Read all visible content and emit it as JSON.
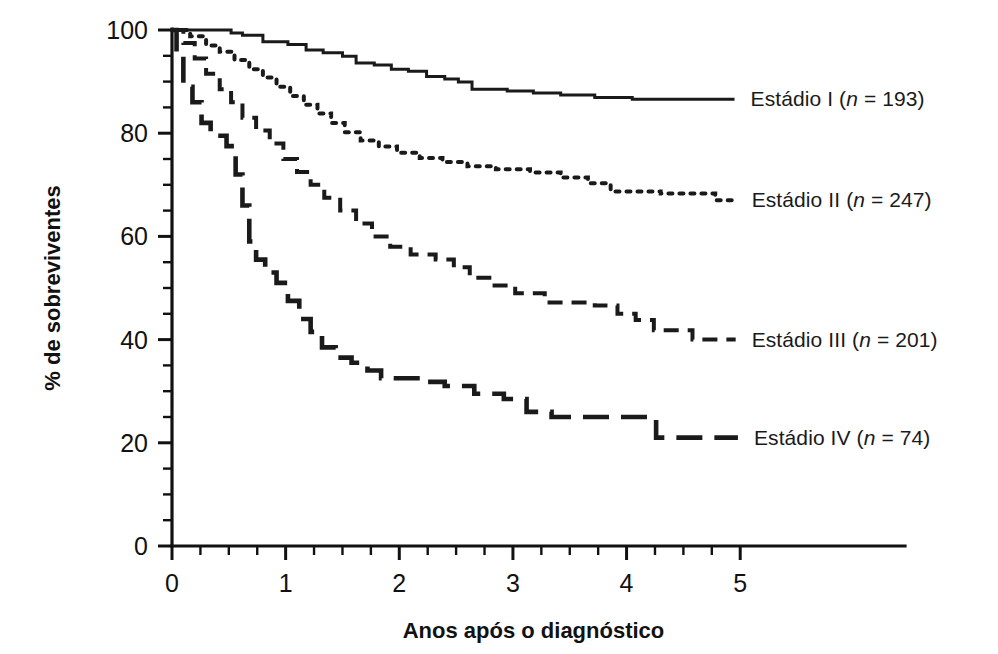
{
  "chart_data": {
    "type": "line",
    "title": "",
    "xlabel": "Anos após o diagnóstico",
    "ylabel": "% de sobreviventes",
    "xlim": [
      0,
      6.45
    ],
    "ylim": [
      0,
      100
    ],
    "grid": false,
    "legend_position": "right-inline",
    "x_ticks_major": [
      "0",
      "1",
      "2",
      "3",
      "4",
      "5"
    ],
    "x_ticks_major_values": [
      0,
      1,
      2,
      3,
      4,
      5
    ],
    "x_minor_step": 0.25,
    "y_ticks_major": [
      "0",
      "20",
      "40",
      "60",
      "80",
      "100"
    ],
    "y_ticks_major_values": [
      0,
      20,
      40,
      60,
      80,
      100
    ],
    "y_minor_step": 5,
    "series": [
      {
        "name": "Estádio I",
        "n": 193,
        "label": "Estádio I (n = 193)",
        "label_prefix": "Estádio I (",
        "label_n": "n",
        "label_suffix": " = 193)",
        "style": "solid",
        "final_value": 87,
        "points": [
          [
            0.0,
            100
          ],
          [
            0.52,
            100
          ],
          [
            0.52,
            99.4
          ],
          [
            0.62,
            99.4
          ],
          [
            0.62,
            99.0
          ],
          [
            0.8,
            99.0
          ],
          [
            0.8,
            97.7
          ],
          [
            1.02,
            97.7
          ],
          [
            1.02,
            97.2
          ],
          [
            1.18,
            97.2
          ],
          [
            1.18,
            96.1
          ],
          [
            1.33,
            96.1
          ],
          [
            1.33,
            95.6
          ],
          [
            1.5,
            95.6
          ],
          [
            1.5,
            94.9
          ],
          [
            1.62,
            94.9
          ],
          [
            1.62,
            93.6
          ],
          [
            1.78,
            93.6
          ],
          [
            1.78,
            93.2
          ],
          [
            1.93,
            93.2
          ],
          [
            1.93,
            92.4
          ],
          [
            2.08,
            92.4
          ],
          [
            2.08,
            92.0
          ],
          [
            2.24,
            92.0
          ],
          [
            2.24,
            91.0
          ],
          [
            2.4,
            91.0
          ],
          [
            2.4,
            90.5
          ],
          [
            2.52,
            90.5
          ],
          [
            2.52,
            89.9
          ],
          [
            2.64,
            89.9
          ],
          [
            2.64,
            88.5
          ],
          [
            2.95,
            88.5
          ],
          [
            2.95,
            88.2
          ],
          [
            3.18,
            88.2
          ],
          [
            3.18,
            87.8
          ],
          [
            3.42,
            87.8
          ],
          [
            3.42,
            87.4
          ],
          [
            3.72,
            87.4
          ],
          [
            3.72,
            86.9
          ],
          [
            4.05,
            86.9
          ],
          [
            4.05,
            86.6
          ],
          [
            4.95,
            86.6
          ]
        ]
      },
      {
        "name": "Estádio II",
        "n": 247,
        "label": "Estádio II (n = 247)",
        "label_prefix": "Estádio II (",
        "label_n": "n",
        "label_suffix": " = 247)",
        "style": "dotted",
        "final_value": 67,
        "points": [
          [
            0.0,
            100
          ],
          [
            0.16,
            100
          ],
          [
            0.16,
            98.8
          ],
          [
            0.3,
            98.8
          ],
          [
            0.3,
            97.0
          ],
          [
            0.42,
            97.0
          ],
          [
            0.42,
            95.8
          ],
          [
            0.55,
            95.8
          ],
          [
            0.55,
            94.2
          ],
          [
            0.68,
            94.2
          ],
          [
            0.68,
            92.4
          ],
          [
            0.8,
            92.4
          ],
          [
            0.8,
            90.8
          ],
          [
            0.92,
            90.8
          ],
          [
            0.92,
            89.0
          ],
          [
            1.04,
            89.0
          ],
          [
            1.04,
            87.2
          ],
          [
            1.16,
            87.2
          ],
          [
            1.16,
            85.5
          ],
          [
            1.28,
            85.5
          ],
          [
            1.28,
            83.8
          ],
          [
            1.4,
            83.8
          ],
          [
            1.4,
            82.0
          ],
          [
            1.52,
            82.0
          ],
          [
            1.52,
            80.2
          ],
          [
            1.66,
            80.2
          ],
          [
            1.66,
            78.6
          ],
          [
            1.82,
            78.6
          ],
          [
            1.82,
            77.4
          ],
          [
            1.98,
            77.4
          ],
          [
            1.98,
            76.2
          ],
          [
            2.18,
            76.2
          ],
          [
            2.18,
            75.2
          ],
          [
            2.38,
            75.2
          ],
          [
            2.38,
            74.4
          ],
          [
            2.6,
            74.4
          ],
          [
            2.6,
            73.6
          ],
          [
            2.85,
            73.6
          ],
          [
            2.85,
            73.0
          ],
          [
            3.15,
            73.0
          ],
          [
            3.15,
            72.4
          ],
          [
            3.42,
            72.4
          ],
          [
            3.42,
            71.4
          ],
          [
            3.66,
            71.4
          ],
          [
            3.66,
            70.3
          ],
          [
            3.86,
            70.3
          ],
          [
            3.86,
            68.7
          ],
          [
            4.3,
            68.7
          ],
          [
            4.3,
            68.3
          ],
          [
            4.78,
            68.3
          ],
          [
            4.78,
            67.0
          ],
          [
            4.96,
            67.0
          ]
        ]
      },
      {
        "name": "Estádio III",
        "n": 201,
        "label": "Estádio III (n = 201)",
        "label_prefix": "Estádio III (",
        "label_n": "n",
        "label_suffix": " = 201)",
        "style": "dashed",
        "final_value": 40,
        "points": [
          [
            0.0,
            100
          ],
          [
            0.1,
            100
          ],
          [
            0.1,
            97.5
          ],
          [
            0.2,
            97.5
          ],
          [
            0.2,
            94.5
          ],
          [
            0.3,
            94.5
          ],
          [
            0.3,
            91.5
          ],
          [
            0.42,
            91.5
          ],
          [
            0.42,
            88.5
          ],
          [
            0.52,
            88.5
          ],
          [
            0.52,
            86.0
          ],
          [
            0.62,
            86.0
          ],
          [
            0.62,
            83.0
          ],
          [
            0.74,
            83.0
          ],
          [
            0.74,
            80.5
          ],
          [
            0.86,
            80.5
          ],
          [
            0.86,
            78.0
          ],
          [
            0.98,
            78.0
          ],
          [
            0.98,
            75.0
          ],
          [
            1.1,
            75.0
          ],
          [
            1.1,
            72.5
          ],
          [
            1.22,
            72.5
          ],
          [
            1.22,
            70.0
          ],
          [
            1.34,
            70.0
          ],
          [
            1.34,
            67.5
          ],
          [
            1.48,
            67.5
          ],
          [
            1.48,
            65.0
          ],
          [
            1.62,
            65.0
          ],
          [
            1.62,
            62.5
          ],
          [
            1.76,
            62.5
          ],
          [
            1.76,
            60.0
          ],
          [
            1.92,
            60.0
          ],
          [
            1.92,
            58.0
          ],
          [
            2.1,
            58.0
          ],
          [
            2.1,
            56.5
          ],
          [
            2.32,
            56.5
          ],
          [
            2.32,
            55.5
          ],
          [
            2.48,
            55.5
          ],
          [
            2.48,
            54.0
          ],
          [
            2.62,
            54.0
          ],
          [
            2.62,
            52.0
          ],
          [
            2.82,
            52.0
          ],
          [
            2.82,
            50.5
          ],
          [
            3.02,
            50.5
          ],
          [
            3.02,
            49.0
          ],
          [
            3.28,
            49.0
          ],
          [
            3.28,
            47.2
          ],
          [
            3.72,
            47.2
          ],
          [
            3.72,
            46.6
          ],
          [
            3.92,
            46.6
          ],
          [
            3.92,
            45.0
          ],
          [
            4.08,
            45.0
          ],
          [
            4.08,
            43.8
          ],
          [
            4.24,
            43.8
          ],
          [
            4.24,
            41.8
          ],
          [
            4.58,
            41.8
          ],
          [
            4.58,
            40.0
          ],
          [
            4.96,
            40.0
          ]
        ]
      },
      {
        "name": "Estádio IV",
        "n": 74,
        "label": "Estádio IV (n = 74)",
        "label_prefix": "Estádio IV (",
        "label_n": "n",
        "label_suffix": " = 74)",
        "style": "long-dashed",
        "final_value": 21,
        "points": [
          [
            0.0,
            100
          ],
          [
            0.04,
            100
          ],
          [
            0.04,
            95.0
          ],
          [
            0.1,
            95.0
          ],
          [
            0.1,
            89.0
          ],
          [
            0.18,
            89.0
          ],
          [
            0.18,
            86.0
          ],
          [
            0.26,
            86.0
          ],
          [
            0.26,
            82.0
          ],
          [
            0.34,
            82.0
          ],
          [
            0.34,
            79.5
          ],
          [
            0.48,
            79.5
          ],
          [
            0.48,
            77.5
          ],
          [
            0.56,
            77.5
          ],
          [
            0.56,
            72.0
          ],
          [
            0.62,
            72.0
          ],
          [
            0.62,
            66.0
          ],
          [
            0.68,
            66.0
          ],
          [
            0.68,
            59.0
          ],
          [
            0.74,
            59.0
          ],
          [
            0.74,
            55.5
          ],
          [
            0.82,
            55.5
          ],
          [
            0.82,
            53.0
          ],
          [
            0.92,
            53.0
          ],
          [
            0.92,
            51.0
          ],
          [
            1.02,
            51.0
          ],
          [
            1.02,
            47.5
          ],
          [
            1.12,
            47.5
          ],
          [
            1.12,
            44.0
          ],
          [
            1.22,
            44.0
          ],
          [
            1.22,
            41.5
          ],
          [
            1.32,
            41.5
          ],
          [
            1.32,
            38.5
          ],
          [
            1.44,
            38.5
          ],
          [
            1.44,
            36.5
          ],
          [
            1.58,
            36.5
          ],
          [
            1.58,
            35.5
          ],
          [
            1.72,
            35.5
          ],
          [
            1.72,
            34.0
          ],
          [
            1.84,
            34.0
          ],
          [
            1.84,
            32.5
          ],
          [
            2.16,
            32.5
          ],
          [
            2.16,
            31.8
          ],
          [
            2.4,
            31.8
          ],
          [
            2.4,
            31.0
          ],
          [
            2.66,
            31.0
          ],
          [
            2.66,
            29.5
          ],
          [
            2.92,
            29.5
          ],
          [
            2.92,
            28.5
          ],
          [
            3.12,
            28.5
          ],
          [
            3.12,
            26.0
          ],
          [
            3.34,
            26.0
          ],
          [
            3.34,
            25.0
          ],
          [
            4.26,
            25.0
          ],
          [
            4.26,
            21.0
          ],
          [
            4.98,
            21.0
          ]
        ]
      }
    ]
  },
  "labels": {
    "stage_i": "Estádio I (n = 193)",
    "stage_ii": "Estádio II (n = 247)",
    "stage_iii": "Estádio III (n = 201)",
    "stage_iv": "Estádio IV (n = 74)"
  },
  "colors": {
    "ink": "#1a1a1a",
    "background": "#ffffff"
  }
}
